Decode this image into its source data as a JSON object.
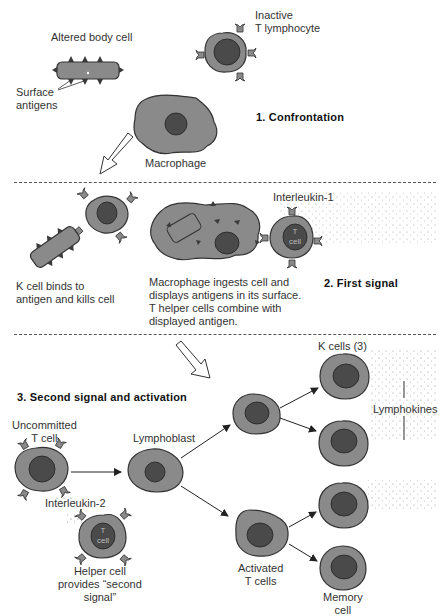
{
  "diagram": {
    "type": "biological process diagram",
    "colors": {
      "cytoplasm": "#8a8a8a",
      "nucleus": "#4a4a4a",
      "outline": "#333333",
      "antigen": "#3a3a3a",
      "divider": "#555555"
    }
  },
  "stages": [
    {
      "title": "1. Confrontation",
      "labels": {
        "altered_cell": "Altered body cell",
        "surface_antigens": "Surface\nantigens",
        "inactive_t": "Inactive\nT lymphocyte",
        "macrophage": "Macrophage"
      }
    },
    {
      "title": "2. First signal",
      "labels": {
        "interleukin1": "Interleukin-1",
        "t4_cell": "T4\ncell",
        "k_cell_kills": "K cell binds to\nantigen and kills cell",
        "macrophage_ingests": "Macrophage ingests cell and\ndisplays antigens in its surface.\nT helper cells combine with\ndisplayed antigen."
      }
    },
    {
      "title": "3. Second signal and activation",
      "labels": {
        "uncommitted": "Uncommitted\nT cell",
        "interleukin2": "Interleukin-2",
        "helper_cell": "Helper cell\nprovides “second\nsignal”",
        "t4_cell": "T4\ncell",
        "lymphoblast": "Lymphoblast",
        "k_cells": "K cells (3)",
        "lymphokines": "Lymphokines",
        "activated": "Activated\nT cells",
        "memory": "Memory\ncell"
      }
    }
  ]
}
